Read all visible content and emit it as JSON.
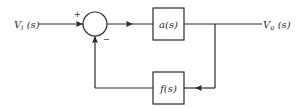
{
  "diagram": {
    "type": "feedback-block-diagram",
    "input": {
      "label": "V",
      "subscript": "i",
      "arg": " (s)"
    },
    "output": {
      "label": "V",
      "subscript": "o",
      "arg": " (s)"
    },
    "summing_junction": {
      "plus_sign": "+",
      "minus_sign": "−"
    },
    "forward_block": {
      "label": "a(s)"
    },
    "feedback_block": {
      "label": "f(s)"
    },
    "colors": {
      "line": "#2a2a2a",
      "background": "#ffffff"
    }
  }
}
